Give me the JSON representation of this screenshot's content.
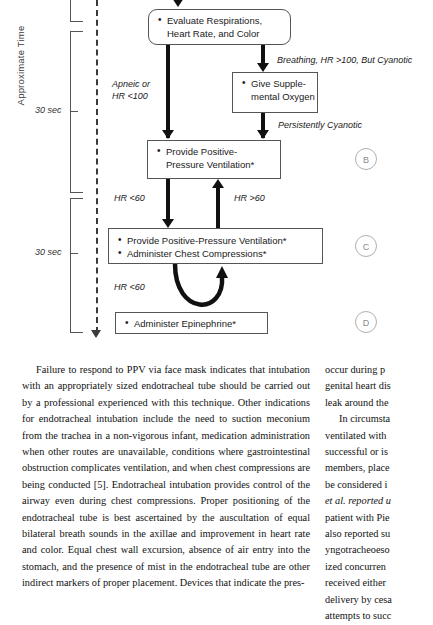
{
  "figure": {
    "axis_title": "Approximate Time",
    "time_labels": [
      {
        "text": "30 sec"
      },
      {
        "text": "30 sec"
      }
    ],
    "boxes": {
      "evaluate": {
        "lines": [
          "Evaluate Respirations,",
          "Heart Rate, and Color"
        ]
      },
      "oxygen": {
        "lines": [
          "Give Supple-",
          "mental Oxygen"
        ]
      },
      "ppv": {
        "lines": [
          "Provide Positive-",
          "Pressure Ventilation*"
        ]
      },
      "ppv_compressions": {
        "items": [
          "Provide Positive-Pressure Ventilation*",
          "Administer Chest Compressions*"
        ]
      },
      "epinephrine": {
        "items": [
          "Administer Epinephrine*"
        ]
      }
    },
    "edge_labels": {
      "breathing_cyanotic": "Breathing, HR >100, But Cyanotic",
      "apneic_line1": "Apneic or",
      "apneic_line2": "HR <100",
      "persistently_cyanotic": "Persistently Cyanotic",
      "hr_lt60_upper": "HR <60",
      "hr_gt60": "HR >60",
      "hr_lt60_lower": "HR <60"
    },
    "circle_tags": [
      "B",
      "C",
      "D"
    ],
    "colors": {
      "box_border": "#555555",
      "arrow": "#111111",
      "timeline": "#3a3a3a",
      "circle_tag": "#b0b0b0"
    }
  },
  "body_text": {
    "left_column": [
      "Failure to respond to PPV via face mask indicates that intubation with an appropriately sized endotracheal tube should be carried out by a professional experienced with this technique. Other indications for endotracheal intubation include the need to suction meconium from the trachea in a non-vigorous infant, medication administration when other routes are unavailable, conditions where gastrointestinal obstruction complicates ventilation, and when chest compressions are being conducted [5]. Endotracheal intubation provides control of the airway even during chest compressions. Proper positioning of the endotracheal tube is best ascertained by the auscultation of equal bilateral breath sounds in the axillae and improvement in heart rate and color. Equal chest wall excursion, absence of air entry into the stomach, and the presence of mist in the endotracheal tube are other indirect markers of proper placement. Devices that indicate the pres-"
    ],
    "right_column_lines": [
      "occur during p",
      "genital heart dis",
      "leak around the",
      "In circumsta",
      "ventilated with",
      "successful or is",
      "members, place",
      "be considered i",
      "et al. reported u",
      "patient with Pie",
      "also reported su",
      "yngotracheoeso",
      "ized concurren",
      "received either",
      "delivery by cesa",
      "attempts to succ"
    ]
  }
}
